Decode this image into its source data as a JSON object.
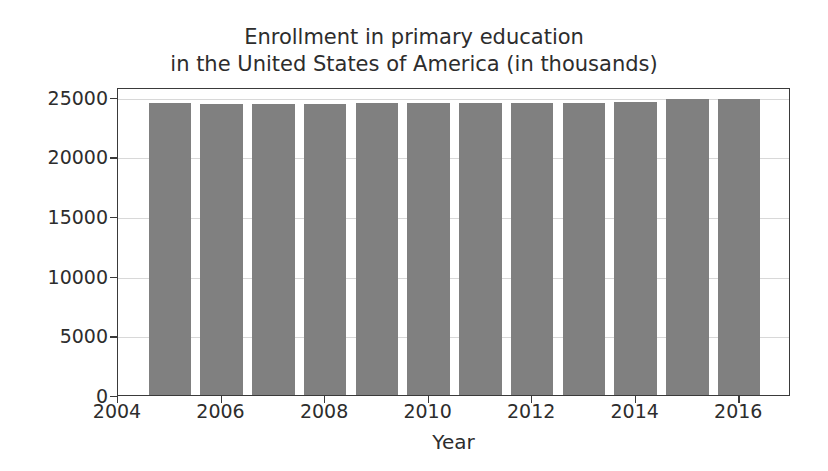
{
  "chart_data": {
    "type": "bar",
    "title": "Enrollment in primary education\nin the United States of America (in thousands)",
    "title_lines": [
      "Enrollment in primary education",
      "in the United States of America (in thousands)"
    ],
    "xlabel": "Year",
    "ylabel": "",
    "categories": [
      2005,
      2006,
      2007,
      2008,
      2009,
      2010,
      2011,
      2012,
      2013,
      2014,
      2015,
      2016
    ],
    "values": [
      24450,
      24400,
      24400,
      24400,
      24450,
      24450,
      24500,
      24500,
      24500,
      24550,
      24800,
      24780
    ],
    "xlim": [
      2004,
      2017
    ],
    "ylim": [
      0,
      25800
    ],
    "yticks": [
      0,
      5000,
      10000,
      15000,
      20000,
      25000
    ],
    "ytick_labels": [
      "0",
      "5000",
      "10000",
      "15000",
      "20000",
      "25000"
    ],
    "xticks": [
      2004,
      2006,
      2008,
      2010,
      2012,
      2014,
      2016
    ],
    "xtick_labels": [
      "2004",
      "2006",
      "2008",
      "2010",
      "2012",
      "2014",
      "2016"
    ],
    "grid": true,
    "grid_axis": "y",
    "legend": null,
    "bar_color": "#808080",
    "bar_width_frac": 0.82,
    "axes_edge_color": "#3a3a3a",
    "grid_color": "#d8d8d8",
    "background_color": "#ffffff"
  }
}
